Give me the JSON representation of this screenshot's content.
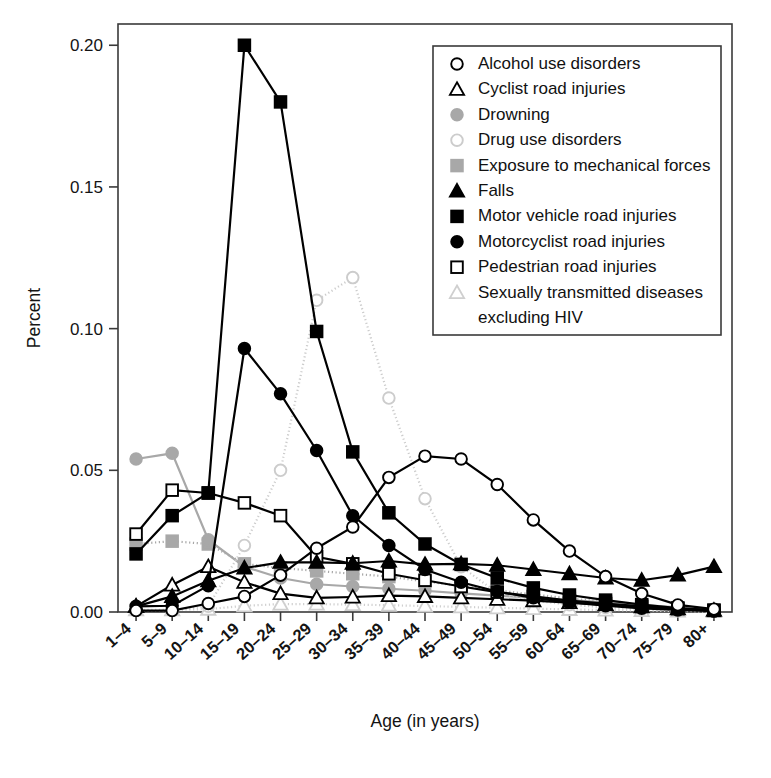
{
  "chart_data": {
    "type": "line",
    "title": "",
    "xlabel": "Age (in years)",
    "ylabel": "Percent",
    "ylim": [
      0.0,
      0.2075
    ],
    "yticks": [
      0.0,
      0.05,
      0.1,
      0.15,
      0.2
    ],
    "ytick_labels": [
      "0.00",
      "0.05",
      "0.10",
      "0.15",
      "0.20"
    ],
    "grid": false,
    "legend_position": "upper right",
    "categories": [
      "1–4",
      "5–9",
      "10–14",
      "15–19",
      "20–24",
      "25–29",
      "30–34",
      "35–39",
      "40–44",
      "45–49",
      "50–54",
      "55–59",
      "60–64",
      "65–69",
      "70–74",
      "75–79",
      "80+"
    ],
    "series": [
      {
        "name": "Alcohol use disorders",
        "marker": "open-circle",
        "color": "#000000",
        "marker_fill": "#ffffff",
        "line_style": "solid",
        "values": [
          0.0005,
          0.0005,
          0.003,
          0.0055,
          0.013,
          0.0225,
          0.03,
          0.0475,
          0.055,
          0.054,
          0.045,
          0.0325,
          0.0215,
          0.0125,
          0.0065,
          0.0025,
          0.001
        ]
      },
      {
        "name": "Cyclist road injuries",
        "marker": "open-triangle",
        "color": "#000000",
        "marker_fill": "#ffffff",
        "line_style": "solid",
        "values": [
          0.002,
          0.0095,
          0.016,
          0.0105,
          0.0065,
          0.005,
          0.0053,
          0.0058,
          0.0055,
          0.005,
          0.0045,
          0.004,
          0.0033,
          0.0026,
          0.0018,
          0.0011,
          0.0006
        ]
      },
      {
        "name": "Drowning",
        "marker": "filled-circle",
        "color": "#a8a8a8",
        "marker_fill": "#a8a8a8",
        "line_style": "solid",
        "values": [
          0.054,
          0.056,
          0.0255,
          0.016,
          0.012,
          0.0098,
          0.009,
          0.0082,
          0.0075,
          0.0066,
          0.0058,
          0.005,
          0.0042,
          0.0034,
          0.0025,
          0.0016,
          0.0008
        ]
      },
      {
        "name": "Drug use disorders",
        "marker": "open-circle",
        "color": "#cccccc",
        "marker_fill": "#ffffff",
        "line_style": "dotted",
        "values": [
          0.0005,
          0.0005,
          0.002,
          0.0235,
          0.05,
          0.11,
          0.118,
          0.0755,
          0.04,
          0.016,
          0.0068,
          0.004,
          0.0026,
          0.0016,
          0.001,
          0.0005,
          0.0002
        ]
      },
      {
        "name": "Exposure to mechanical forces",
        "marker": "filled-square",
        "color": "#a8a8a8",
        "marker_fill": "#a8a8a8",
        "line_style": "dotted",
        "values": [
          0.024,
          0.025,
          0.024,
          0.017,
          0.0155,
          0.0145,
          0.0135,
          0.0125,
          0.0108,
          0.0092,
          0.0076,
          0.0062,
          0.0048,
          0.0036,
          0.0024,
          0.0014,
          0.0006
        ]
      },
      {
        "name": "Falls",
        "marker": "filled-triangle",
        "color": "#000000",
        "marker_fill": "#000000",
        "line_style": "solid",
        "values": [
          0.002,
          0.0055,
          0.011,
          0.0155,
          0.0175,
          0.0175,
          0.0172,
          0.018,
          0.0168,
          0.017,
          0.0165,
          0.015,
          0.0135,
          0.012,
          0.0112,
          0.013,
          0.016
        ]
      },
      {
        "name": "Motor vehicle road injuries",
        "marker": "filled-square",
        "color": "#000000",
        "marker_fill": "#000000",
        "line_style": "solid",
        "values": [
          0.0205,
          0.034,
          0.042,
          0.2,
          0.18,
          0.099,
          0.0565,
          0.035,
          0.024,
          0.0168,
          0.012,
          0.0085,
          0.006,
          0.0042,
          0.0026,
          0.0014,
          0.0006
        ]
      },
      {
        "name": "Motorcyclist road injuries",
        "marker": "filled-circle",
        "color": "#000000",
        "marker_fill": "#000000",
        "line_style": "solid",
        "values": [
          0.002,
          0.0022,
          0.0093,
          0.093,
          0.077,
          0.057,
          0.034,
          0.0235,
          0.015,
          0.0105,
          0.0072,
          0.005,
          0.0034,
          0.0022,
          0.0013,
          0.0007,
          0.0003
        ]
      },
      {
        "name": "Pedestrian road injuries",
        "marker": "open-square",
        "color": "#000000",
        "marker_fill": "#ffffff",
        "line_style": "solid",
        "values": [
          0.0275,
          0.043,
          0.042,
          0.0385,
          0.034,
          0.0195,
          0.017,
          0.0135,
          0.0112,
          0.009,
          0.007,
          0.0055,
          0.004,
          0.003,
          0.002,
          0.0012,
          0.0006
        ]
      },
      {
        "name": "Sexually transmitted diseases excluding HIV",
        "marker": "open-triangle",
        "color": "#cfcfcf",
        "marker_fill": "#ffffff",
        "line_style": "dotted",
        "values": [
          0.0008,
          0.0008,
          0.001,
          0.0022,
          0.0028,
          0.0028,
          0.0026,
          0.0024,
          0.0021,
          0.0018,
          0.0015,
          0.0012,
          0.0009,
          0.0007,
          0.0005,
          0.0003,
          0.0002
        ]
      }
    ],
    "legend_entries": [
      {
        "label": "Alcohol use disorders",
        "marker": "open-circle",
        "color": "#000000"
      },
      {
        "label": "Cyclist road injuries",
        "marker": "open-triangle",
        "color": "#000000"
      },
      {
        "label": "Drowning",
        "marker": "filled-circle",
        "color": "#a8a8a8"
      },
      {
        "label": "Drug use disorders",
        "marker": "open-circle",
        "color": "#cccccc"
      },
      {
        "label": "Exposure to mechanical forces",
        "marker": "filled-square",
        "color": "#a8a8a8"
      },
      {
        "label": "Falls",
        "marker": "filled-triangle",
        "color": "#000000"
      },
      {
        "label": "Motor vehicle road injuries",
        "marker": "filled-square",
        "color": "#000000"
      },
      {
        "label": "Motorcyclist road injuries",
        "marker": "filled-circle",
        "color": "#000000"
      },
      {
        "label": "Pedestrian road injuries",
        "marker": "open-square",
        "color": "#000000"
      },
      {
        "label": "Sexually transmitted diseases",
        "marker": "open-triangle",
        "color": "#cfcfcf"
      },
      {
        "label": "excluding HIV",
        "marker": "none",
        "color": "#000000"
      }
    ]
  }
}
